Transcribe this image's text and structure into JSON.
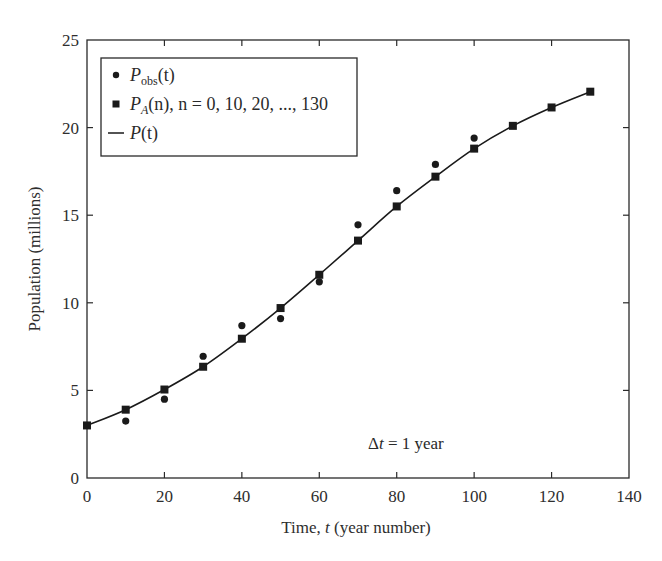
{
  "chart_data": {
    "type": "scatter",
    "title": "",
    "xlabel": "Time, t (year number)",
    "ylabel": "Population (millions)",
    "xlim": [
      0,
      140
    ],
    "ylim": [
      0,
      25
    ],
    "x_ticks": [
      0,
      20,
      40,
      60,
      80,
      100,
      120,
      140
    ],
    "y_ticks": [
      0,
      5,
      10,
      15,
      20,
      25
    ],
    "grid": false,
    "legend_position": "upper left",
    "legend": [
      {
        "marker": "circle",
        "label": "P_obs(t)"
      },
      {
        "marker": "square",
        "label": "P_A(n), n = 0, 10, 20, ..., 130"
      },
      {
        "marker": "line",
        "label": "P(t)"
      }
    ],
    "annotations": [
      {
        "text": "Δt = 1 year",
        "x": 90,
        "y": 2
      }
    ],
    "series": [
      {
        "name": "P_obs(t)",
        "marker": "circle",
        "x": [
          10,
          20,
          30,
          40,
          50,
          60,
          70,
          80,
          90,
          100
        ],
        "y": [
          3.25,
          4.5,
          6.95,
          8.7,
          9.1,
          11.2,
          14.45,
          16.4,
          17.9,
          19.4
        ]
      },
      {
        "name": "P_A(n)",
        "marker": "square",
        "x": [
          0,
          10,
          20,
          30,
          40,
          50,
          60,
          70,
          80,
          90,
          100,
          110,
          120,
          130
        ],
        "y": [
          3.0,
          3.9,
          5.05,
          6.35,
          7.95,
          9.7,
          11.6,
          13.55,
          15.5,
          17.2,
          18.8,
          20.1,
          21.15,
          22.05
        ]
      },
      {
        "name": "P(t)",
        "marker": "line",
        "x": [
          0,
          10,
          20,
          30,
          40,
          50,
          60,
          70,
          80,
          90,
          100,
          110,
          120,
          130
        ],
        "y": [
          3.0,
          3.9,
          5.05,
          6.35,
          7.95,
          9.7,
          11.6,
          13.55,
          15.5,
          17.2,
          18.8,
          20.1,
          21.15,
          22.05
        ]
      }
    ]
  },
  "labels": {
    "xlabel_main": "Time, ",
    "xlabel_var": "t",
    "xlabel_rest": " (year number)",
    "ylabel": "Population (millions)",
    "annotation_delta": "Δ",
    "annotation_var": "t",
    "annotation_rest": " = 1 year"
  },
  "legend": {
    "obs_main": "P",
    "obs_sub": "obs",
    "obs_rest": "(t)",
    "pa_main": "P",
    "pa_sub": "A",
    "pa_rest": "(n), n = 0, 10, 20, ..., 130",
    "p_main": "P",
    "p_rest": "(t)"
  },
  "style": {
    "ink": "#1a1a1a",
    "axis": "#2a2a2a"
  }
}
